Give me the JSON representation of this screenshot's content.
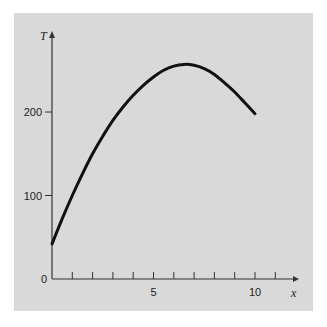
{
  "chart_data": {
    "type": "line",
    "title": "",
    "xlabel": "x",
    "ylabel": "T",
    "xlim": [
      0,
      11.5
    ],
    "ylim": [
      0,
      290
    ],
    "x_ticks_minor": [
      1,
      2,
      3,
      4,
      5,
      6,
      7,
      8,
      9,
      10,
      11
    ],
    "x_tick_labels": [
      {
        "value": 5,
        "label": "5"
      },
      {
        "value": 10,
        "label": "10"
      }
    ],
    "y_tick_labels": [
      {
        "value": 0,
        "label": "0"
      },
      {
        "value": 100,
        "label": "100"
      },
      {
        "value": 200,
        "label": "200"
      }
    ],
    "grid": false,
    "legend": null,
    "series": [
      {
        "name": "T(x)",
        "x": [
          0,
          0.5,
          1,
          1.5,
          2,
          2.5,
          3,
          3.5,
          4,
          4.5,
          5,
          5.5,
          6,
          6.5,
          7,
          7.5,
          8,
          8.5,
          9,
          9.5,
          10
        ],
        "values": [
          42,
          72,
          100,
          126,
          150,
          171,
          190,
          206,
          220,
          232,
          242,
          250,
          255,
          257,
          256,
          252,
          245,
          235,
          224,
          211,
          198
        ]
      }
    ],
    "colors": {
      "panel": "#d9d9d9",
      "line": "#111111",
      "axis": "#333333"
    }
  }
}
